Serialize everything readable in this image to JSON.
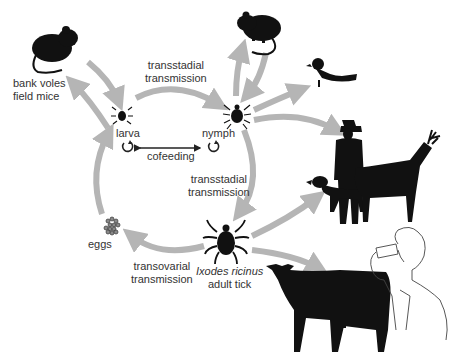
{
  "diagram": {
    "colors": {
      "arrow": "#b5b5b5",
      "silhouette": "#111111",
      "text": "#333333",
      "cofeeding_arrow": "#222222"
    },
    "labels": {
      "rodent_hosts_line1": "bank voles",
      "rodent_hosts_line2": "field mice",
      "transstadial_top_line1": "transstadial",
      "transstadial_top_line2": "transmission",
      "larva": "larva",
      "nymph": "nymph",
      "cofeeding": "cofeeding",
      "transstadial_right_line1": "transstadial",
      "transstadial_right_line2": "transmission",
      "eggs": "eggs",
      "transovarial_line1": "transovarial",
      "transovarial_line2": "transmission",
      "adult_species": "Ixodes ricinus",
      "adult_label": "adult tick"
    },
    "nodes": [
      {
        "id": "rodent-left",
        "icon": "mouse-icon"
      },
      {
        "id": "rodent-top",
        "icon": "mouse-icon"
      },
      {
        "id": "bird",
        "icon": "bird-icon"
      },
      {
        "id": "human-hunter",
        "icon": "human-icon"
      },
      {
        "id": "dog",
        "icon": "dog-icon"
      },
      {
        "id": "deer",
        "icon": "deer-icon"
      },
      {
        "id": "cow",
        "icon": "cow-icon"
      },
      {
        "id": "milk-drinker",
        "icon": "person-drinking-icon"
      },
      {
        "id": "larva",
        "icon": "tick-icon"
      },
      {
        "id": "nymph",
        "icon": "tick-icon"
      },
      {
        "id": "adult",
        "icon": "tick-icon"
      },
      {
        "id": "eggs",
        "icon": "eggs-icon"
      }
    ]
  }
}
